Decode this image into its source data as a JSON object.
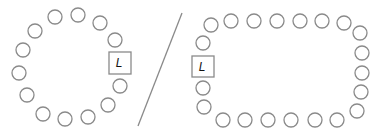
{
  "diagram": {
    "style": {
      "stroke_color": "#8a8a8a",
      "text_color": "#111111",
      "background": "#ffffff",
      "seat_radius": 7
    },
    "round_table": {
      "seat_count": 13,
      "seats": [
        {
          "x": 55,
          "y": 17
        },
        {
          "x": 78,
          "y": 15
        },
        {
          "x": 100,
          "y": 23
        },
        {
          "x": 115,
          "y": 40
        },
        {
          "x": 120,
          "y": 86
        },
        {
          "x": 108,
          "y": 105
        },
        {
          "x": 88,
          "y": 117
        },
        {
          "x": 65,
          "y": 119
        },
        {
          "x": 43,
          "y": 114
        },
        {
          "x": 27,
          "y": 95
        },
        {
          "x": 19,
          "y": 73
        },
        {
          "x": 23,
          "y": 50
        },
        {
          "x": 35,
          "y": 31
        }
      ],
      "leader": {
        "label": "L",
        "x": 109,
        "y": 52,
        "w": 22,
        "h": 22
      }
    },
    "divider": {
      "x1": 182,
      "y1": 13,
      "x2": 138,
      "y2": 126
    },
    "rect_table": {
      "seat_count": 23,
      "seats": [
        {
          "x": 211,
          "y": 25
        },
        {
          "x": 231,
          "y": 21
        },
        {
          "x": 254,
          "y": 21
        },
        {
          "x": 277,
          "y": 21
        },
        {
          "x": 300,
          "y": 21
        },
        {
          "x": 322,
          "y": 21
        },
        {
          "x": 344,
          "y": 23
        },
        {
          "x": 360,
          "y": 33
        },
        {
          "x": 362,
          "y": 53
        },
        {
          "x": 362,
          "y": 73
        },
        {
          "x": 361,
          "y": 92
        },
        {
          "x": 357,
          "y": 111
        },
        {
          "x": 337,
          "y": 120
        },
        {
          "x": 315,
          "y": 120
        },
        {
          "x": 291,
          "y": 120
        },
        {
          "x": 268,
          "y": 120
        },
        {
          "x": 245,
          "y": 120
        },
        {
          "x": 223,
          "y": 120
        },
        {
          "x": 204,
          "y": 107
        },
        {
          "x": 203,
          "y": 88
        },
        {
          "x": 203,
          "y": 43
        }
      ],
      "leader": {
        "label": "L",
        "x": 192,
        "y": 56,
        "w": 22,
        "h": 21
      }
    }
  }
}
